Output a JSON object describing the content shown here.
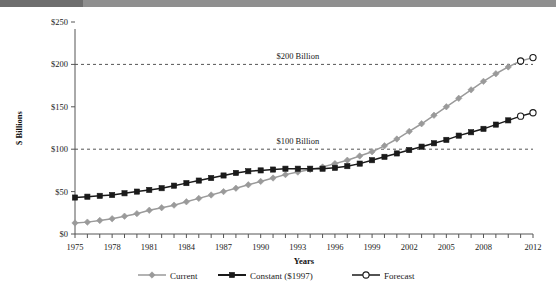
{
  "topbar": {
    "bg_color": "#8f8f8f",
    "left_block_color": "#6e6e6e"
  },
  "chart_data": {
    "type": "line",
    "title": "",
    "xlabel": "Years",
    "ylabel": "$ Billions",
    "xlim": [
      1975,
      2012
    ],
    "ylim": [
      0,
      250
    ],
    "ytick_labels": [
      "$0",
      "$50",
      "$100",
      "$150",
      "$200",
      "$250"
    ],
    "ytick_values": [
      0,
      50,
      100,
      150,
      200,
      250
    ],
    "xtick_labels": [
      "1975",
      "1978",
      "1981",
      "1984",
      "1987",
      "1990",
      "1993",
      "1996",
      "1999",
      "2002",
      "2005",
      "2008",
      "2012"
    ],
    "xtick_values": [
      1975,
      1978,
      1981,
      1984,
      1987,
      1990,
      1993,
      1996,
      1999,
      2002,
      2005,
      2008,
      2012
    ],
    "grid": false,
    "legend_position": "bottom",
    "annotations": [
      {
        "text": "$200 Billion",
        "y": 200,
        "x": 1993
      },
      {
        "text": "$100 Billion",
        "y": 100,
        "x": 1993
      }
    ],
    "reference_lines": [
      {
        "value": 200,
        "style": "dashed",
        "color": "#555555"
      },
      {
        "value": 100,
        "style": "dashed",
        "color": "#555555"
      }
    ],
    "x": [
      1975,
      1976,
      1977,
      1978,
      1979,
      1980,
      1981,
      1982,
      1983,
      1984,
      1985,
      1986,
      1987,
      1988,
      1989,
      1990,
      1991,
      1992,
      1993,
      1994,
      1995,
      1996,
      1997,
      1998,
      1999,
      2000,
      2001,
      2002,
      2003,
      2004,
      2005,
      2006,
      2007,
      2008,
      2009,
      2010,
      2011,
      2012
    ],
    "series": [
      {
        "name": "Current",
        "color": "#9a9a9a",
        "marker": "diamond",
        "values": [
          13,
          14,
          16,
          18,
          21,
          24,
          28,
          31,
          34,
          38,
          42,
          46,
          50,
          54,
          58,
          62,
          66,
          70,
          73,
          76,
          79,
          83,
          87,
          92,
          97,
          104,
          112,
          121,
          130,
          140,
          150,
          160,
          170,
          180,
          189,
          197,
          204,
          208
        ],
        "forecast_from": 2011
      },
      {
        "name": "Constant ($1997)",
        "color": "#1a1a1a",
        "marker": "square",
        "values": [
          43,
          44,
          45,
          46,
          48,
          50,
          52,
          54,
          57,
          60,
          63,
          66,
          69,
          72,
          74,
          75,
          76,
          77,
          77,
          77,
          77,
          78,
          80,
          83,
          87,
          91,
          95,
          99,
          103,
          107,
          111,
          116,
          120,
          124,
          129,
          134,
          139,
          143
        ],
        "forecast_from": 2011
      }
    ],
    "legend": [
      {
        "label": "Current",
        "color": "#9a9a9a",
        "marker": "diamond"
      },
      {
        "label": "Constant ($1997)",
        "color": "#1a1a1a",
        "marker": "square"
      },
      {
        "label": "Forecast",
        "color": "#1a1a1a",
        "marker": "open-circle"
      }
    ]
  }
}
